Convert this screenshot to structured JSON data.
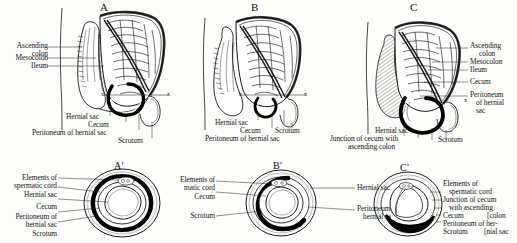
{
  "figure": {
    "background_color": "#fdfdfb",
    "ink_color": "#141414",
    "fill_black": "#000000"
  },
  "panels": [
    {
      "letter": "A",
      "left_labels": [
        "Ascending colon",
        "Mesocolon",
        "Ileum"
      ],
      "bottom_labels": [
        "Hernial sac",
        "Cecum",
        "Peritoneum of hernial sac",
        "Scrotum"
      ],
      "section_marks": [
        "x",
        "x"
      ]
    },
    {
      "letter": "B",
      "left_labels": [],
      "bottom_labels": [
        "Hernial sac",
        "Cecum",
        "Scrotum",
        "Peritoneum of hernial sac"
      ],
      "section_marks": [
        "x",
        "x"
      ]
    },
    {
      "letter": "C",
      "right_labels": [
        "Ascending colon",
        "Mesocolon",
        "Ileum",
        "Cecum",
        "Peritoneum of hernial sac"
      ],
      "bottom_labels": [
        "Hernial sac",
        "Junction of cecum with ascending colon",
        "Scrotum"
      ],
      "section_marks": [
        "x"
      ]
    }
  ],
  "sections": [
    {
      "letter": "A′",
      "left_labels": [
        "Elements of spermatic cord",
        "Hernial sac",
        "Cecum",
        "Peritoneum of hernial sac",
        "Scrotum"
      ]
    },
    {
      "letter": "B′",
      "left_labels": [
        "Elements of spermatic cord",
        "Cecum",
        "Scrotum"
      ],
      "right_labels": [
        "Hernial sac",
        "Peritoneum of hernial sac"
      ]
    },
    {
      "letter": "C′",
      "right_labels": [
        "Elements of spermatic cord",
        "Junction of cecum with ascending [colon",
        "Cecum",
        "Peritoneum of her-",
        "Scrotum  [nial sac"
      ]
    }
  ],
  "text": {
    "a_ascending": "Ascending",
    "a_colon": "colon",
    "a_mesocolon": "Mesocolon",
    "a_ileum": "Ileum",
    "a_hernial_sac": "Hernial sac",
    "a_cecum": "Cecum",
    "a_peritoneum": "Peritoneum of hernial sac",
    "a_scrotum": "Scrotum",
    "a_letter": "A",
    "b_hernial_sac": "Hernial sac",
    "b_cecum": "Cecum",
    "b_scrotum": "Scrotum",
    "b_peritoneum": "Peritoneum of hernial sac",
    "b_letter": "B",
    "c_ascending": "Ascending",
    "c_colon": "colon",
    "c_mesocolon": "Mesocolon",
    "c_ileum": "Ileum",
    "c_cecum": "Cecum",
    "c_peritoneum1": "Peritoneum",
    "c_peritoneum2": "of hernial",
    "c_peritoneum3": "sac",
    "c_hernial_sac": "Hernial sac",
    "c_junction1": "Junction of cecum with",
    "c_junction2": "ascending colon",
    "c_scrotum": "Scrotum",
    "c_letter": "C",
    "ap_elements1": "Elements of",
    "ap_elements2": "spermatic cord",
    "ap_hernial_sac": "Hernial sac",
    "ap_cecum": "Cecum",
    "ap_peritoneum1": "Peritoneum of",
    "ap_peritoneum2": "hernial sac",
    "ap_scrotum": "Scrotum",
    "ap_letter": "A′",
    "bp_elements1": "Elements of",
    "bp_elements2": "matic cord",
    "bp_cecum": "Cecum",
    "bp_scrotum": "Scrotum",
    "bp_hernial_sac": "Hernial sac",
    "bp_peritoneum1": "Peritoneum",
    "bp_peritoneum2": "hernial sa",
    "bp_letter": "B′",
    "cp_elements1": "Elements of",
    "cp_elements2": "spermatic cord",
    "cp_junction1": "Junction of cecum",
    "cp_junction2": "with ascending",
    "cp_cecum": "Cecum",
    "cp_colon": "[colon",
    "cp_peritoneum": "Peritoneum of her-",
    "cp_scrotum": "Scrotum",
    "cp_nialsac": "[nial sac",
    "cp_letter": "C′",
    "xmark": "x"
  }
}
